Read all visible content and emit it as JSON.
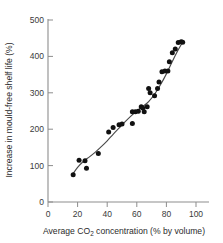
{
  "chart_data": {
    "type": "scatter",
    "title": "",
    "xlabel": "Average CO2 concentration (% by volume)",
    "xlabel_main": "Average CO",
    "xlabel_sub": "2",
    "xlabel_tail": " concentration (% by volume)",
    "ylabel": "Increase in mould-free shelf life (%)",
    "xlim": [
      0,
      113
    ],
    "ylim": [
      0,
      520
    ],
    "xticks": [
      0,
      20,
      40,
      60,
      80,
      100
    ],
    "yticks": [
      0,
      100,
      200,
      300,
      400,
      500
    ],
    "grid": false,
    "legend": null,
    "point_color": "#111111",
    "curve_color": "#4a4a4a",
    "axis_color": "#8d8d8d",
    "points": [
      {
        "x": 17,
        "y": 75
      },
      {
        "x": 21,
        "y": 115
      },
      {
        "x": 25,
        "y": 113
      },
      {
        "x": 26,
        "y": 93
      },
      {
        "x": 34,
        "y": 133
      },
      {
        "x": 41,
        "y": 192
      },
      {
        "x": 44,
        "y": 205
      },
      {
        "x": 48,
        "y": 212
      },
      {
        "x": 50,
        "y": 214
      },
      {
        "x": 57,
        "y": 216
      },
      {
        "x": 57,
        "y": 248
      },
      {
        "x": 59,
        "y": 248
      },
      {
        "x": 61,
        "y": 249
      },
      {
        "x": 63,
        "y": 262
      },
      {
        "x": 64,
        "y": 258
      },
      {
        "x": 65,
        "y": 248
      },
      {
        "x": 67,
        "y": 262
      },
      {
        "x": 68,
        "y": 312
      },
      {
        "x": 69,
        "y": 300
      },
      {
        "x": 72,
        "y": 292
      },
      {
        "x": 74,
        "y": 312
      },
      {
        "x": 75,
        "y": 330
      },
      {
        "x": 77,
        "y": 358
      },
      {
        "x": 79,
        "y": 360
      },
      {
        "x": 81,
        "y": 360
      },
      {
        "x": 82,
        "y": 385
      },
      {
        "x": 84,
        "y": 410
      },
      {
        "x": 86,
        "y": 420
      },
      {
        "x": 88,
        "y": 438
      },
      {
        "x": 90,
        "y": 440
      },
      {
        "x": 91,
        "y": 439
      }
    ],
    "fit_curve": [
      {
        "x": 17,
        "y": 78
      },
      {
        "x": 20,
        "y": 95
      },
      {
        "x": 24,
        "y": 112
      },
      {
        "x": 28,
        "y": 124
      },
      {
        "x": 32,
        "y": 137
      },
      {
        "x": 36,
        "y": 152
      },
      {
        "x": 40,
        "y": 168
      },
      {
        "x": 44,
        "y": 186
      },
      {
        "x": 48,
        "y": 203
      },
      {
        "x": 52,
        "y": 220
      },
      {
        "x": 56,
        "y": 236
      },
      {
        "x": 60,
        "y": 250
      },
      {
        "x": 64,
        "y": 262
      },
      {
        "x": 68,
        "y": 276
      },
      {
        "x": 72,
        "y": 296
      },
      {
        "x": 76,
        "y": 322
      },
      {
        "x": 80,
        "y": 352
      },
      {
        "x": 84,
        "y": 386
      },
      {
        "x": 88,
        "y": 418
      },
      {
        "x": 91,
        "y": 440
      }
    ]
  }
}
